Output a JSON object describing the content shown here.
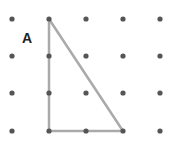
{
  "diagram": {
    "type": "geoboard-dot-grid",
    "grid": {
      "columns": 5,
      "rows": 4,
      "x_positions": [
        12,
        49,
        86,
        123,
        160
      ],
      "y_positions": [
        19,
        56,
        93,
        131
      ],
      "dot_color": "#555555",
      "dot_radius": 2.6
    },
    "shape": {
      "name": "right triangle",
      "label": "A",
      "vertices_grid": [
        [
          1,
          0
        ],
        [
          1,
          3
        ],
        [
          3,
          3
        ]
      ],
      "stroke_color": "#aaaaaa",
      "stroke_width": 2.5
    },
    "label_position": {
      "x": 22,
      "y": 30
    }
  }
}
